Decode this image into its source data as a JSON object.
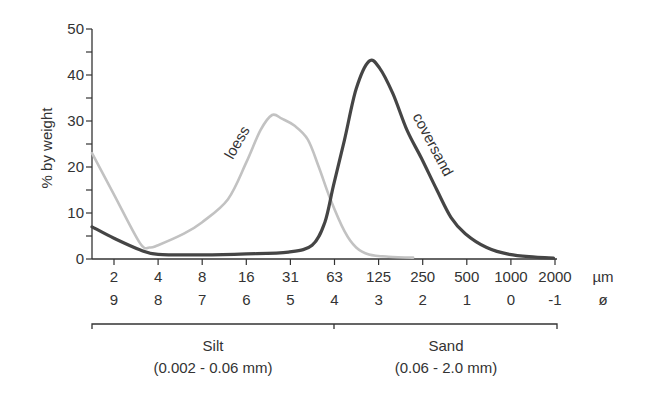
{
  "chart_data": {
    "type": "line",
    "title": "",
    "ylabel": "% by weight",
    "xlabel": "",
    "ylim": [
      0,
      50
    ],
    "yticks": [
      "0",
      "10",
      "20",
      "30",
      "40",
      "50"
    ],
    "x_ticks_um": [
      "2",
      "4",
      "8",
      "16",
      "31",
      "63",
      "125",
      "250",
      "500",
      "1000",
      "2000"
    ],
    "x_ticks_phi": [
      "9",
      "8",
      "7",
      "6",
      "5",
      "4",
      "3",
      "2",
      "1",
      "0",
      "-1"
    ],
    "x_unit_um": "µm",
    "x_unit_phi": "ø",
    "x_scale": "log2",
    "grid": false,
    "legend": "inline labels on curves",
    "series": [
      {
        "name": "loess",
        "color": "#c2c2c2",
        "points_um_pct": [
          [
            1.4,
            23
          ],
          [
            2,
            14
          ],
          [
            3,
            3.5
          ],
          [
            3.5,
            2.5
          ],
          [
            4,
            3
          ],
          [
            6,
            5.5
          ],
          [
            8,
            8
          ],
          [
            12,
            13
          ],
          [
            16,
            21
          ],
          [
            20,
            28
          ],
          [
            24,
            31.3
          ],
          [
            28,
            30.5
          ],
          [
            34,
            29
          ],
          [
            42,
            26
          ],
          [
            50,
            20
          ],
          [
            60,
            13
          ],
          [
            75,
            6
          ],
          [
            90,
            2.5
          ],
          [
            110,
            1
          ],
          [
            150,
            0.5
          ],
          [
            220,
            0.3
          ]
        ]
      },
      {
        "name": "coversand",
        "color": "#454545",
        "points_um_pct": [
          [
            1.4,
            7
          ],
          [
            2,
            4.5
          ],
          [
            3,
            2
          ],
          [
            4,
            1
          ],
          [
            8,
            0.9
          ],
          [
            16,
            1.1
          ],
          [
            31,
            1.5
          ],
          [
            45,
            3
          ],
          [
            55,
            8
          ],
          [
            63,
            16
          ],
          [
            75,
            26
          ],
          [
            90,
            37
          ],
          [
            110,
            43
          ],
          [
            130,
            41.5
          ],
          [
            160,
            36
          ],
          [
            200,
            28
          ],
          [
            250,
            22
          ],
          [
            320,
            15
          ],
          [
            400,
            9
          ],
          [
            500,
            5.5
          ],
          [
            700,
            2.5
          ],
          [
            1000,
            1
          ],
          [
            1500,
            0.4
          ],
          [
            2000,
            0.2
          ]
        ]
      }
    ],
    "annotations": [
      {
        "text": "loess",
        "near": "rising limb of loess curve"
      },
      {
        "text": "coversand",
        "near": "falling limb of coversand curve"
      }
    ],
    "ranges": [
      {
        "name": "Silt",
        "range": "(0.002 - 0.06 mm)"
      },
      {
        "name": "Sand",
        "range": "(0.06 - 2.0 mm)"
      }
    ]
  }
}
